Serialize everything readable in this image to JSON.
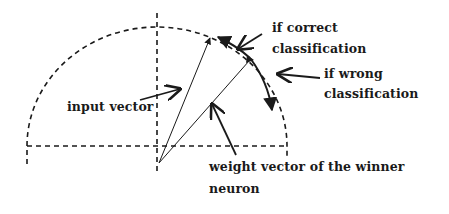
{
  "diagram": {
    "type": "vector-geometry",
    "colors": {
      "ink": "#1a1a1a",
      "background": "#ffffff"
    },
    "labels": {
      "input_vector": "input vector",
      "if_correct_line1": "if correct",
      "if_correct_line2": "classification",
      "if_wrong_line1": "if wrong",
      "if_wrong_line2": "classification",
      "weight_line1": "weight vector of the winner",
      "weight_line2": "neuron"
    }
  }
}
